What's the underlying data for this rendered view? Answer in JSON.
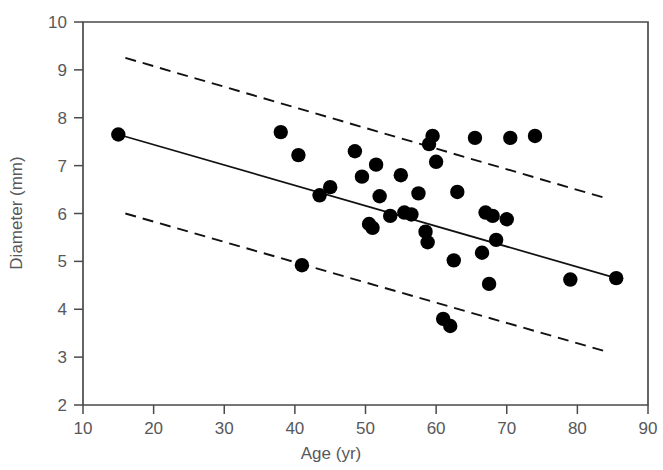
{
  "chart_data": {
    "type": "scatter",
    "title": "",
    "xlabel": "Age (yr)",
    "ylabel": "Diameter (mm)",
    "xlim": [
      10,
      90
    ],
    "ylim": [
      2,
      10
    ],
    "xticks": [
      10,
      20,
      30,
      40,
      50,
      60,
      70,
      80,
      90
    ],
    "yticks": [
      2,
      3,
      4,
      5,
      6,
      7,
      8,
      9,
      10
    ],
    "xtick_labels": [
      "10",
      "20",
      "30",
      "40",
      "50",
      "60",
      "70",
      "80",
      "90"
    ],
    "ytick_labels": [
      "2",
      "3",
      "4",
      "5",
      "6",
      "7",
      "8",
      "9",
      "10"
    ],
    "grid": false,
    "legend": "none",
    "marker": "filled-circle",
    "marker_color": "#000000",
    "points": [
      {
        "x": 15.0,
        "y": 7.65
      },
      {
        "x": 38.0,
        "y": 7.7
      },
      {
        "x": 40.5,
        "y": 7.22
      },
      {
        "x": 41.0,
        "y": 4.92
      },
      {
        "x": 43.5,
        "y": 6.38
      },
      {
        "x": 45.0,
        "y": 6.55
      },
      {
        "x": 48.5,
        "y": 7.3
      },
      {
        "x": 49.5,
        "y": 6.77
      },
      {
        "x": 50.5,
        "y": 5.78
      },
      {
        "x": 51.0,
        "y": 5.7
      },
      {
        "x": 51.5,
        "y": 7.02
      },
      {
        "x": 52.0,
        "y": 6.36
      },
      {
        "x": 53.5,
        "y": 5.95
      },
      {
        "x": 55.0,
        "y": 6.8
      },
      {
        "x": 55.5,
        "y": 6.02
      },
      {
        "x": 56.5,
        "y": 5.98
      },
      {
        "x": 57.5,
        "y": 6.42
      },
      {
        "x": 58.5,
        "y": 5.62
      },
      {
        "x": 58.8,
        "y": 5.4
      },
      {
        "x": 59.0,
        "y": 7.45
      },
      {
        "x": 59.5,
        "y": 7.62
      },
      {
        "x": 60.0,
        "y": 7.08
      },
      {
        "x": 61.0,
        "y": 3.8
      },
      {
        "x": 62.0,
        "y": 3.65
      },
      {
        "x": 62.5,
        "y": 5.02
      },
      {
        "x": 63.0,
        "y": 6.45
      },
      {
        "x": 65.5,
        "y": 7.58
      },
      {
        "x": 66.5,
        "y": 5.18
      },
      {
        "x": 67.0,
        "y": 6.02
      },
      {
        "x": 67.5,
        "y": 4.53
      },
      {
        "x": 68.0,
        "y": 5.95
      },
      {
        "x": 68.5,
        "y": 5.45
      },
      {
        "x": 70.0,
        "y": 5.88
      },
      {
        "x": 70.5,
        "y": 7.58
      },
      {
        "x": 74.0,
        "y": 7.62
      },
      {
        "x": 79.0,
        "y": 4.62
      },
      {
        "x": 85.5,
        "y": 4.65
      }
    ],
    "regression_line": {
      "name": "fitted regression line",
      "style": "solid",
      "x": [
        15.0,
        85.5
      ],
      "y": [
        7.65,
        4.65
      ]
    },
    "confidence_bands": [
      {
        "name": "upper prediction limit",
        "style": "dashed",
        "x": [
          16.0,
          84.5
        ],
        "y": [
          9.25,
          6.3
        ]
      },
      {
        "name": "lower prediction limit",
        "style": "dashed",
        "x": [
          16.0,
          84.5
        ],
        "y": [
          6.0,
          3.1
        ]
      }
    ]
  },
  "axes": {
    "x_title": "Age (yr)",
    "y_title": "Diameter (mm)"
  }
}
